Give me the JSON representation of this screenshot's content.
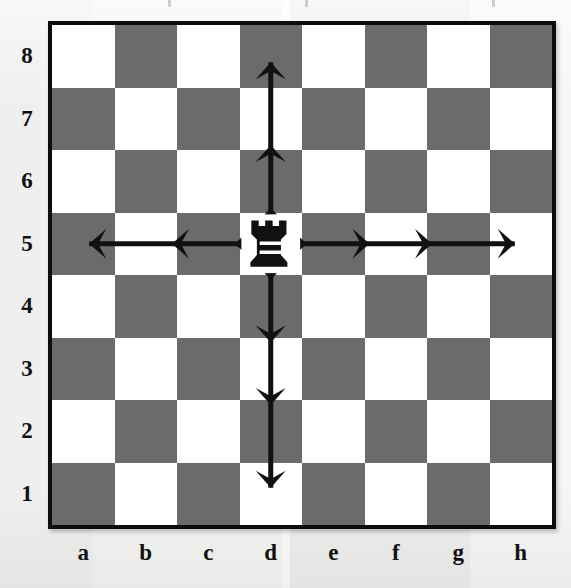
{
  "diagram": {
    "type": "chess-board-diagram",
    "board_size": 8,
    "piece": {
      "name": "rook",
      "color": "black",
      "square": "d5",
      "file_index": 3,
      "rank_index": 4
    },
    "colors": {
      "light_square": "#ffffff",
      "dark_square": "#6b6b6b",
      "border": "#0d0d0d",
      "arrow": "#111111",
      "page_background": "#f2f2f0",
      "label_text": "#111111"
    },
    "light_square_corner": "a8",
    "rank_labels": [
      "8",
      "7",
      "6",
      "5",
      "4",
      "3",
      "2",
      "1"
    ],
    "file_labels": [
      "a",
      "b",
      "c",
      "d",
      "e",
      "f",
      "g",
      "h"
    ],
    "arrows": [
      {
        "name": "rank5-left",
        "direction": "left",
        "from": "d5",
        "to": "a5",
        "arrowhead_squares": [
          "c5",
          "b5",
          "a5"
        ],
        "arrowhead_count": 3
      },
      {
        "name": "rank5-right",
        "direction": "right",
        "from": "d5",
        "to": "h5",
        "arrowhead_squares": [
          "e5",
          "f5",
          "g5",
          "h5"
        ],
        "arrowhead_count": 4
      },
      {
        "name": "dfile-up",
        "direction": "up",
        "from": "d5",
        "to": "d8",
        "arrowhead_squares": [
          "d6",
          "d7",
          "d8"
        ],
        "arrowhead_count": 3
      },
      {
        "name": "dfile-down",
        "direction": "down",
        "from": "d5",
        "to": "d1",
        "arrowhead_squares": [
          "d4",
          "d3",
          "d2",
          "d1"
        ],
        "arrowhead_count": 4
      }
    ],
    "cut_marks": [
      {
        "name": "cut-mark-1",
        "x": 168
      },
      {
        "name": "cut-mark-2",
        "x": 305
      },
      {
        "name": "cut-mark-3",
        "x": 492
      }
    ]
  }
}
